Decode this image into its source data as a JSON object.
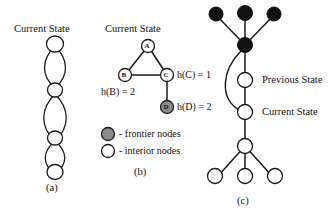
{
  "figure": {
    "panels": [
      {
        "id": "a",
        "caption": "(a)",
        "state_label": "Current State",
        "description": "chain of interior nodes linked by lens shaped double edges",
        "node_count": 4,
        "lens_count": 3
      },
      {
        "id": "b",
        "caption": "(b)",
        "state_label": "Current State",
        "nodes": [
          {
            "id": "A",
            "label": "A",
            "type": "interior"
          },
          {
            "id": "B",
            "label": "B",
            "type": "interior"
          },
          {
            "id": "C",
            "label": "C",
            "type": "interior"
          },
          {
            "id": "D",
            "label": "D",
            "type": "frontier"
          }
        ],
        "edges": [
          {
            "from": "A",
            "to": "B"
          },
          {
            "from": "A",
            "to": "C"
          },
          {
            "from": "B",
            "to": "C"
          },
          {
            "from": "C",
            "to": "D"
          }
        ],
        "heuristics": [
          {
            "text": "h(C) = 1",
            "node": "C"
          },
          {
            "text": "h(B) = 2",
            "node": "B"
          },
          {
            "text": "h(D) = 2",
            "node": "D"
          }
        ]
      },
      {
        "id": "c",
        "caption": "(c)",
        "annotations": [
          {
            "text": "Previous State"
          },
          {
            "text": "Current State"
          }
        ],
        "frontier_node_count": 4,
        "interior_node_count": 5
      }
    ],
    "legend": {
      "items": [
        {
          "swatch": "frontier-node-swatch",
          "text": "- frontier nodes"
        },
        {
          "swatch": "interior-node-swatch",
          "text": "- interior nodes"
        }
      ]
    },
    "colors": {
      "frontier_fill": "#8c8c8c",
      "interior_fill": "#ffffff",
      "solid_fill": "#111111",
      "stroke": "#1a1a1a",
      "background": "#ffffff"
    }
  }
}
